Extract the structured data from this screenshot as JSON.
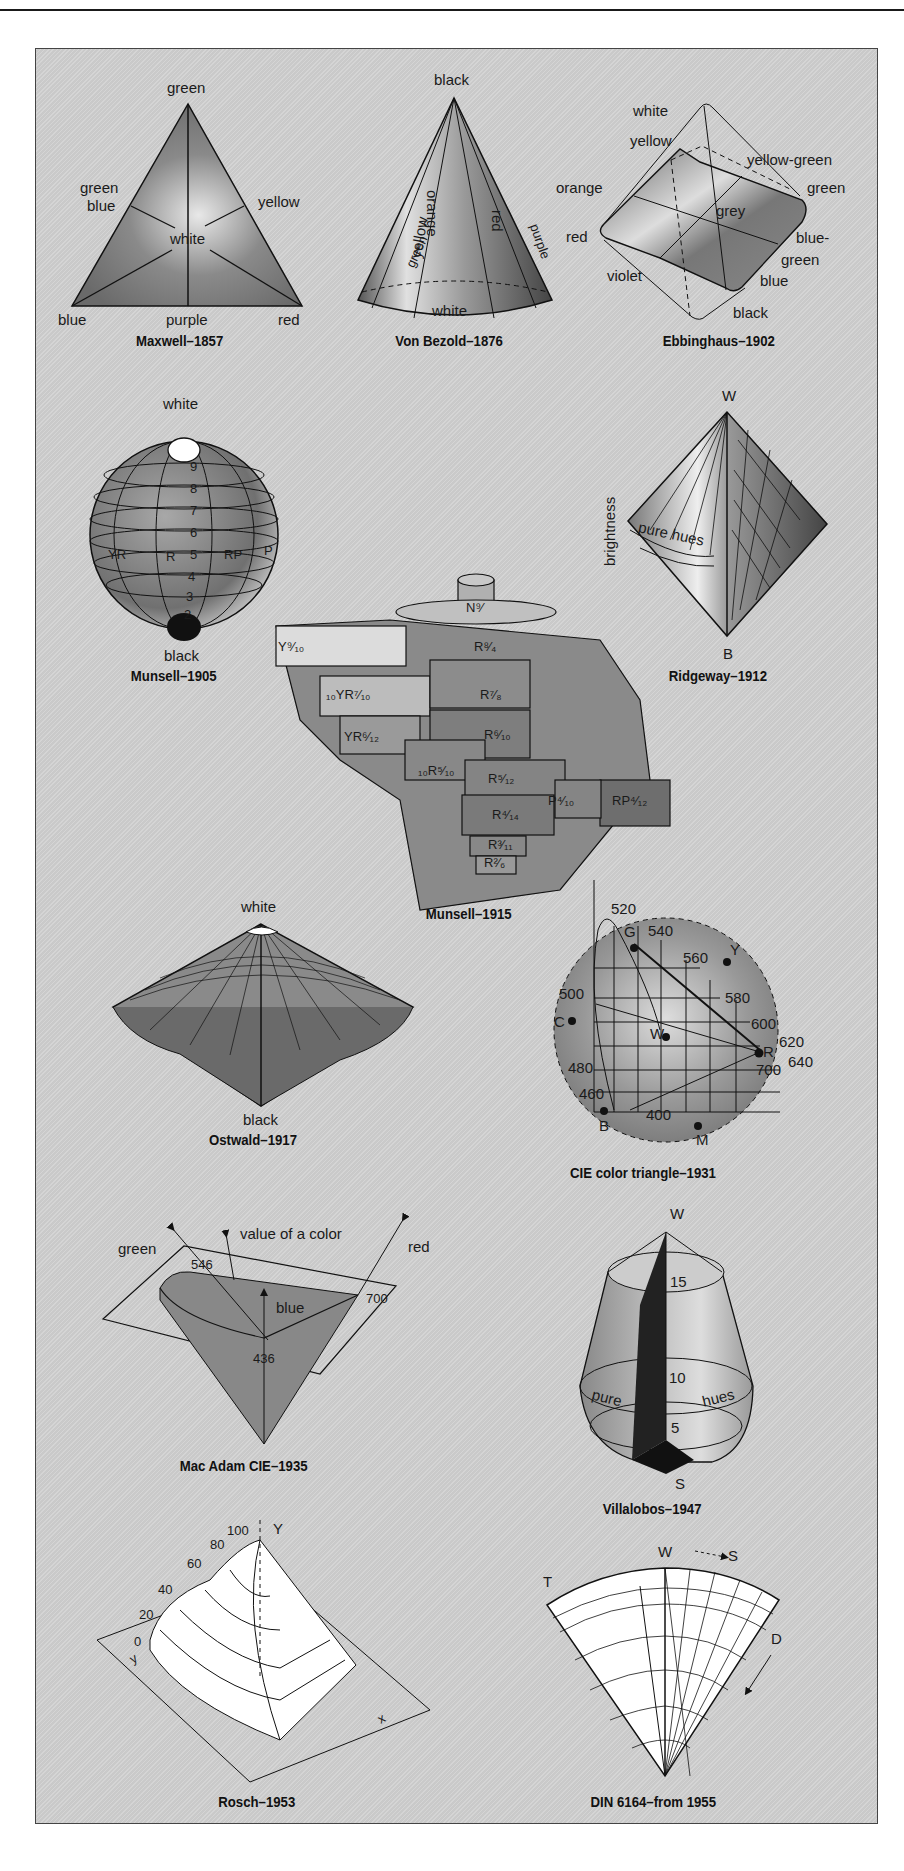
{
  "figure": {
    "systems": [
      {
        "id": "maxwell",
        "caption": "Maxwell–1857",
        "labels": {
          "top": "green",
          "left": "green\nblue",
          "left_1": "green",
          "left_2": "blue",
          "right": "yellow",
          "center": "white",
          "bottom_left": "blue",
          "bottom_center": "purple",
          "bottom_right": "red"
        }
      },
      {
        "id": "vonbezold",
        "caption": "Von Bezold–1876",
        "labels": {
          "apex": "black",
          "band_1": "green",
          "band_2": "yellow",
          "band_3": "orange",
          "band_4": "red",
          "band_5": "purple",
          "base": "white"
        }
      },
      {
        "id": "ebbinghaus",
        "caption": "Ebbinghaus–1902",
        "labels": {
          "white": "white",
          "yellow": "yellow",
          "yellow_green": "yellow-green",
          "orange": "orange",
          "green": "green",
          "grey": "grey",
          "red": "red",
          "blue_green_1": "blue-",
          "blue_green_2": "green",
          "violet": "violet",
          "blue": "blue",
          "black": "black"
        }
      },
      {
        "id": "munsell1905",
        "caption": "Munsell–1905",
        "labels": {
          "top": "white",
          "bottom": "black",
          "values": [
            "9",
            "8",
            "7",
            "6",
            "5",
            "4",
            "3",
            "2"
          ],
          "hues": [
            "YR",
            "R",
            "RP",
            "P"
          ]
        }
      },
      {
        "id": "ridgeway",
        "caption": "Ridgeway–1912",
        "labels": {
          "top": "W",
          "bottom": "B",
          "axis": "brightness",
          "band": "pure hues"
        }
      },
      {
        "id": "munsell1915",
        "caption": "Munsell–1915",
        "labels": {
          "top": "N⁹⁄",
          "row1": "R⁸⁄₄",
          "row2": "R⁷⁄₈",
          "row3": "R⁶⁄₁₀",
          "row4": "R⁵⁄₁₂",
          "row5": "R⁴⁄₁₄",
          "row6": "R³⁄₁₁",
          "row7": "R²⁄₆",
          "left1": "Y⁹⁄₁₀",
          "left2": "₁₀YR⁷⁄₁₀",
          "left3": "YR⁶⁄₁₂",
          "left4": "₁₀R⁵⁄₁₀",
          "right1": "P⁴⁄₁₀",
          "right2": "RP⁴⁄₁₂"
        }
      },
      {
        "id": "ostwald",
        "caption": "Ostwald–1917",
        "labels": {
          "top": "white",
          "bottom": "black",
          "rim_left": [
            "8",
            "7",
            "1P",
            "3R"
          ],
          "rim_right": [
            "10",
            "20",
            "30"
          ]
        }
      },
      {
        "id": "cie1931",
        "caption": "CIE color triangle–1931",
        "labels": {
          "wavelengths": [
            "520",
            "540",
            "560",
            "580",
            "600",
            "620",
            "640",
            "700",
            "500",
            "480",
            "460",
            "400"
          ],
          "points": [
            "G",
            "Y",
            "C",
            "W",
            "R",
            "B",
            "M"
          ]
        }
      },
      {
        "id": "macadam",
        "caption": "Mac Adam CIE–1935",
        "labels": {
          "green": "green",
          "value": "value of a color",
          "red": "red",
          "w546": "546",
          "w700": "700",
          "blue": "blue",
          "w436": "436"
        }
      },
      {
        "id": "villalobos",
        "caption": "Villalobos–1947",
        "labels": {
          "top": "W",
          "bottom": "S",
          "v15": "15",
          "v10": "10",
          "v5": "5",
          "band_1": "pure",
          "band_2": "hues"
        }
      },
      {
        "id": "rosch",
        "caption": "Rosch–1953",
        "labels": {
          "axis_y": "Y",
          "ticks": [
            "100",
            "80",
            "60",
            "40",
            "20",
            "0"
          ],
          "axis_x": "x",
          "axis_y2": "y"
        }
      },
      {
        "id": "din",
        "caption": "DIN 6164–from 1955",
        "labels": {
          "W": "W",
          "S": "S",
          "T": "T",
          "D": "D"
        }
      }
    ]
  },
  "colors": {
    "panel": "#d0d0d0",
    "ink": "#1a1a1a",
    "frame": "#444444"
  }
}
